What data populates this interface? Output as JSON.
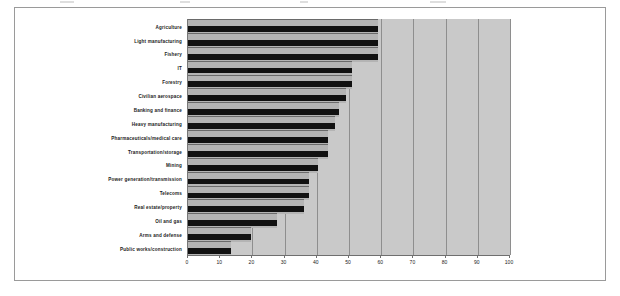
{
  "figure": {
    "frame_color": "#9a9a9a",
    "plot_background": "#c9c9c9",
    "band_color": "#b4b4b4",
    "bar_color": "#111111"
  },
  "chart_data": {
    "type": "bar",
    "orientation": "horizontal",
    "title": "",
    "subtitle": "",
    "xlabel": "",
    "ylabel": "",
    "xlim": [
      0,
      100
    ],
    "xticks": [
      0,
      10,
      20,
      30,
      40,
      50,
      60,
      70,
      80,
      90,
      100
    ],
    "xtick_labels": [
      "0",
      "10",
      "20",
      "30",
      "40",
      "50",
      "60",
      "70",
      "80",
      "90",
      "100"
    ],
    "grid": true,
    "grid_axis": "x",
    "legend": false,
    "legend_position": "none",
    "categories": [
      "Agriculture",
      "Light manufacturing",
      "Fishery",
      "IT",
      "Forestry",
      "Civilian aerospace",
      "Banking and finance",
      "Heavy manufacturing",
      "Pharmaceuticals/medical care",
      "Transportation/storage",
      "Mining",
      "Power generation/transmission",
      "Telecoms",
      "Real estate/property",
      "Oil and gas",
      "Arms and defense",
      "Public works/construction"
    ],
    "values": [
      59,
      59,
      59,
      51,
      51,
      49,
      47,
      45.5,
      43.5,
      43.5,
      40.5,
      37.5,
      37.5,
      36,
      27.5,
      19.5,
      13.5
    ]
  }
}
